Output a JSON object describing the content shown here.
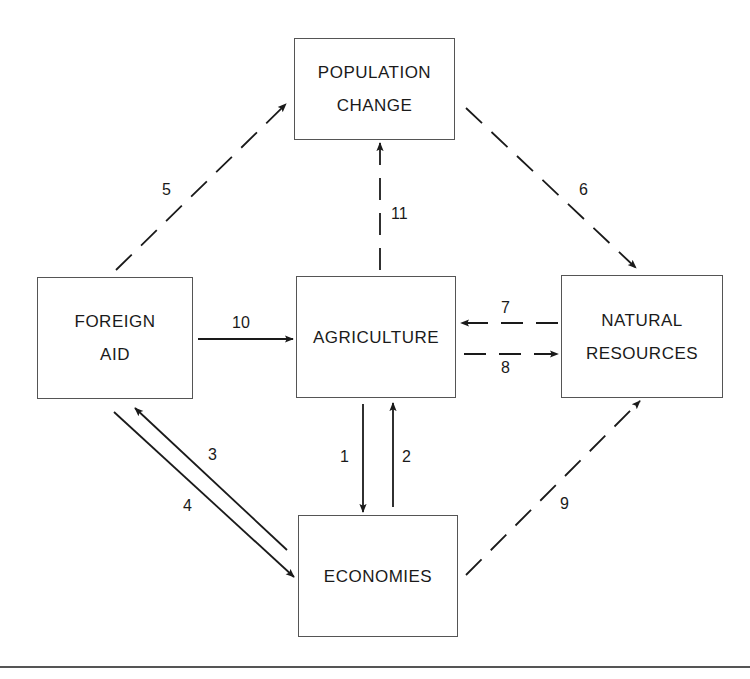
{
  "diagram": {
    "nodes": [
      {
        "id": "population_change",
        "lines": [
          "POPULATION",
          "CHANGE"
        ]
      },
      {
        "id": "foreign_aid",
        "lines": [
          "FOREIGN",
          "AID"
        ]
      },
      {
        "id": "agriculture",
        "lines": [
          "AGRICULTURE"
        ]
      },
      {
        "id": "natural_resources",
        "lines": [
          "NATURAL",
          "RESOURCES"
        ]
      },
      {
        "id": "economies",
        "lines": [
          "ECONOMIES"
        ]
      }
    ],
    "edges": [
      {
        "label": "1",
        "from": "agriculture",
        "to": "economies",
        "style": "solid"
      },
      {
        "label": "2",
        "from": "economies",
        "to": "agriculture",
        "style": "solid"
      },
      {
        "label": "3",
        "from": "economies",
        "to": "foreign_aid",
        "style": "solid"
      },
      {
        "label": "4",
        "from": "foreign_aid",
        "to": "economies",
        "style": "solid"
      },
      {
        "label": "5",
        "from": "foreign_aid",
        "to": "population_change",
        "style": "dashed"
      },
      {
        "label": "6",
        "from": "population_change",
        "to": "natural_resources",
        "style": "dashed"
      },
      {
        "label": "7",
        "from": "natural_resources",
        "to": "agriculture",
        "style": "dashed"
      },
      {
        "label": "8",
        "from": "agriculture",
        "to": "natural_resources",
        "style": "dashed"
      },
      {
        "label": "9",
        "from": "economies",
        "to": "natural_resources",
        "style": "dashed"
      },
      {
        "label": "10",
        "from": "foreign_aid",
        "to": "agriculture",
        "style": "solid"
      },
      {
        "label": "11",
        "from": "agriculture",
        "to": "population_change",
        "style": "dashed"
      }
    ]
  },
  "colors": {
    "line": "#1a1a1a",
    "border": "#555555",
    "background": "#ffffff"
  }
}
